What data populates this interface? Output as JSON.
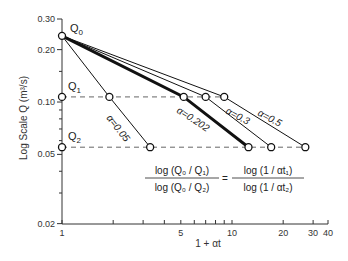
{
  "chart_data": {
    "type": "line",
    "title": "",
    "xlabel": "1 + αt",
    "ylabel": "Log Scale Q (m³/s)",
    "xscale": "log",
    "yscale": "log",
    "xlim": [
      1,
      40
    ],
    "ylim": [
      0.02,
      0.3
    ],
    "x_ticks": [
      {
        "value": 1,
        "label": "1"
      },
      {
        "value": 2,
        "label": ""
      },
      {
        "value": 3,
        "label": ""
      },
      {
        "value": 4,
        "label": ""
      },
      {
        "value": 5,
        "label": "5"
      },
      {
        "value": 6,
        "label": ""
      },
      {
        "value": 7,
        "label": ""
      },
      {
        "value": 8,
        "label": ""
      },
      {
        "value": 9,
        "label": ""
      },
      {
        "value": 10,
        "label": "10"
      },
      {
        "value": 20,
        "label": "20"
      },
      {
        "value": 30,
        "label": "30"
      },
      {
        "value": 40,
        "label": "40"
      }
    ],
    "y_ticks": [
      {
        "value": 0.3,
        "label": "0.30"
      },
      {
        "value": 0.2,
        "label": "0.20"
      },
      {
        "value": 0.15,
        "label": ""
      },
      {
        "value": 0.1,
        "label": "0.10"
      },
      {
        "value": 0.09,
        "label": ""
      },
      {
        "value": 0.08,
        "label": ""
      },
      {
        "value": 0.07,
        "label": ""
      },
      {
        "value": 0.06,
        "label": ""
      },
      {
        "value": 0.05,
        "label": "0.05"
      },
      {
        "value": 0.04,
        "label": ""
      },
      {
        "value": 0.03,
        "label": ""
      },
      {
        "value": 0.02,
        "label": "0.02"
      }
    ],
    "reference_points": [
      {
        "name": "Q0",
        "label": "Q",
        "sub": "0",
        "x": 1,
        "y": 0.24
      },
      {
        "name": "Q1",
        "label": "Q",
        "sub": "1",
        "x": 1,
        "y": 0.107
      },
      {
        "name": "Q2",
        "label": "Q",
        "sub": "2",
        "x": 1,
        "y": 0.055
      }
    ],
    "horizontal_refs": [
      {
        "name": "Q1-level",
        "y": 0.107,
        "x_end": 9.0,
        "style": "dashed"
      },
      {
        "name": "Q2-level",
        "y": 0.055,
        "x_end": 27.0,
        "style": "dashed"
      }
    ],
    "series": [
      {
        "name": "α=0.05",
        "label": "α=0.05",
        "bold": false,
        "points": [
          [
            1,
            0.24
          ],
          [
            1.9,
            0.107
          ],
          [
            3.3,
            0.055
          ]
        ]
      },
      {
        "name": "α=0.202",
        "label": "α=0.202",
        "bold": true,
        "points": [
          [
            1,
            0.24
          ],
          [
            5.2,
            0.107
          ],
          [
            12.5,
            0.055
          ]
        ]
      },
      {
        "name": "α=0.3",
        "label": "α=0.3",
        "bold": false,
        "points": [
          [
            1,
            0.24
          ],
          [
            7.0,
            0.107
          ],
          [
            17.0,
            0.055
          ]
        ]
      },
      {
        "name": "α=0.5",
        "label": "α=0.5",
        "bold": false,
        "points": [
          [
            1,
            0.24
          ],
          [
            9.0,
            0.107
          ],
          [
            27.0,
            0.055
          ]
        ]
      }
    ],
    "annotation": {
      "lhs_num": "log (Q₀ / Q₁)",
      "lhs_den": "log (Q₀ / Q₂)",
      "equals": "=",
      "rhs_num": "log (1 / αt₁)",
      "rhs_den": "log (1 / αt₂)"
    },
    "grid": false,
    "legend": "none"
  }
}
